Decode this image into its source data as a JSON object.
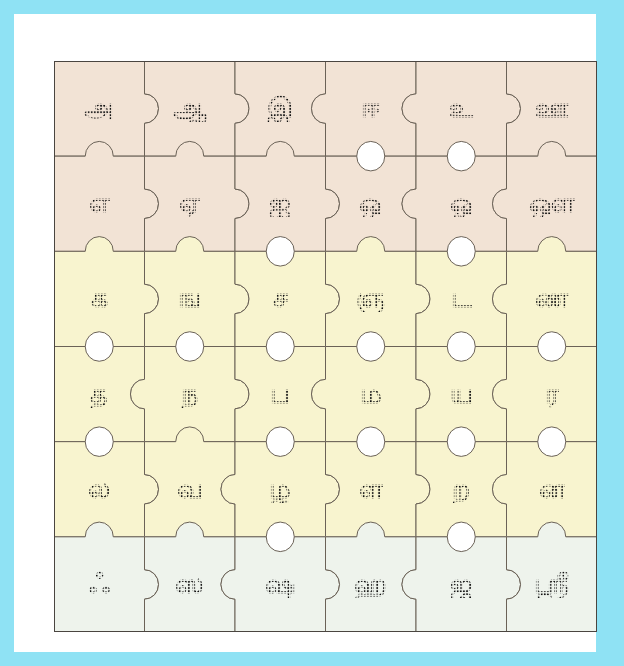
{
  "page": {
    "frame_color": "#8fe2f4",
    "mat_color": "#ffffff",
    "board_border_color": "#4a4540",
    "piece_outline_color": "#6b6257",
    "glyph_color": "#141414",
    "glyph_style": "dotted-trace"
  },
  "board": {
    "columns": 6,
    "rows": 6,
    "row_colors": [
      "#f2e3d5",
      "#f2e3d5",
      "#f8f4cf",
      "#f8f4cf",
      "#f8f4cf",
      "#eef3ec"
    ],
    "grid": [
      {
        "row": 1,
        "group": "uyir",
        "background": "#f2e3d5",
        "cells": [
          {
            "col": 1,
            "glyph": "அ",
            "name": "a"
          },
          {
            "col": 2,
            "glyph": "ஆ",
            "name": "aa"
          },
          {
            "col": 3,
            "glyph": "இ",
            "name": "i"
          },
          {
            "col": 4,
            "glyph": "ஈ",
            "name": "ii"
          },
          {
            "col": 5,
            "glyph": "உ",
            "name": "u"
          },
          {
            "col": 6,
            "glyph": "ஊ",
            "name": "uu"
          }
        ]
      },
      {
        "row": 2,
        "group": "uyir",
        "background": "#f2e3d5",
        "cells": [
          {
            "col": 1,
            "glyph": "எ",
            "name": "e"
          },
          {
            "col": 2,
            "glyph": "ஏ",
            "name": "ee"
          },
          {
            "col": 3,
            "glyph": "ஐ",
            "name": "ai"
          },
          {
            "col": 4,
            "glyph": "ஒ",
            "name": "o"
          },
          {
            "col": 5,
            "glyph": "ஓ",
            "name": "oo"
          },
          {
            "col": 6,
            "glyph": "ஔ",
            "name": "au"
          }
        ]
      },
      {
        "row": 3,
        "group": "mei",
        "background": "#f8f4cf",
        "cells": [
          {
            "col": 1,
            "glyph": "க",
            "name": "ka"
          },
          {
            "col": 2,
            "glyph": "ங",
            "name": "nga"
          },
          {
            "col": 3,
            "glyph": "ச",
            "name": "cha"
          },
          {
            "col": 4,
            "glyph": "ஞ",
            "name": "nya"
          },
          {
            "col": 5,
            "glyph": "ட",
            "name": "ta"
          },
          {
            "col": 6,
            "glyph": "ண",
            "name": "na-retroflex"
          }
        ]
      },
      {
        "row": 4,
        "group": "mei",
        "background": "#f8f4cf",
        "cells": [
          {
            "col": 1,
            "glyph": "த",
            "name": "tha"
          },
          {
            "col": 2,
            "glyph": "ந",
            "name": "nha"
          },
          {
            "col": 3,
            "glyph": "ப",
            "name": "pa"
          },
          {
            "col": 4,
            "glyph": "ம",
            "name": "ma"
          },
          {
            "col": 5,
            "glyph": "ய",
            "name": "ya"
          },
          {
            "col": 6,
            "glyph": "ர",
            "name": "ra"
          }
        ]
      },
      {
        "row": 5,
        "group": "mei",
        "background": "#f8f4cf",
        "cells": [
          {
            "col": 1,
            "glyph": "ல",
            "name": "la"
          },
          {
            "col": 2,
            "glyph": "வ",
            "name": "va"
          },
          {
            "col": 3,
            "glyph": "ழ",
            "name": "zha"
          },
          {
            "col": 4,
            "glyph": "ள",
            "name": "lla"
          },
          {
            "col": 5,
            "glyph": "ற",
            "name": "rra"
          },
          {
            "col": 6,
            "glyph": "ன",
            "name": "nna"
          }
        ]
      },
      {
        "row": 6,
        "group": "aytham-grantha",
        "background": "#eef3ec",
        "cells": [
          {
            "col": 1,
            "glyph": "ஃ",
            "name": "aytham"
          },
          {
            "col": 2,
            "glyph": "ஸ",
            "name": "sa"
          },
          {
            "col": 3,
            "glyph": "ஷ",
            "name": "sha"
          },
          {
            "col": 4,
            "glyph": "ஹ",
            "name": "ha"
          },
          {
            "col": 5,
            "glyph": "ஜ",
            "name": "ja"
          },
          {
            "col": 6,
            "glyph": "ஶ்ரீ",
            "name": "shri"
          }
        ]
      }
    ]
  }
}
